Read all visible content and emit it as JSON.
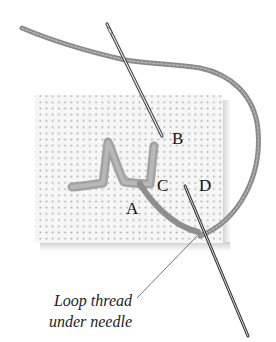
{
  "illustration": {
    "subject": "embroidery stitch diagram",
    "labels": {
      "a": "A",
      "b": "B",
      "c": "C",
      "d": "D"
    },
    "caption": {
      "line1": "Loop thread",
      "line2": "under needle"
    },
    "colors": {
      "background": "#ffffff",
      "fabric": "#f4f4f4",
      "fabric_holes": "#9a9a9a",
      "thread": "#8e8e8e",
      "needle": "#555555",
      "text": "#111111"
    }
  }
}
